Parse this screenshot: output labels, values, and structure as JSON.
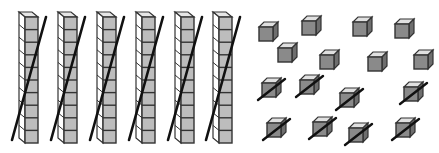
{
  "figure": {
    "colors": {
      "background": "#ffffff",
      "outline": "#333333",
      "rod_front": "#bdbdbd",
      "rod_side": "#ffffff",
      "rod_top": "#e6e6e6",
      "cube_front": "#8a8a8a",
      "cube_top": "#e0e0e0",
      "cube_side": "#6e6e6e",
      "strike": "#111111"
    },
    "rods": {
      "count": 6,
      "cells_per_rod": 10,
      "crossed_out": true,
      "items": [
        {
          "x": 19,
          "crossed": true
        },
        {
          "x": 58,
          "crossed": true
        },
        {
          "x": 97,
          "crossed": true
        },
        {
          "x": 136,
          "crossed": true
        },
        {
          "x": 175,
          "crossed": true
        },
        {
          "x": 213,
          "crossed": true
        }
      ]
    },
    "units": {
      "count": 16,
      "crossed_count": 8,
      "items": [
        {
          "x": 259,
          "y": 22,
          "crossed": false
        },
        {
          "x": 302,
          "y": 16,
          "crossed": false
        },
        {
          "x": 353,
          "y": 17,
          "crossed": false
        },
        {
          "x": 395,
          "y": 19,
          "crossed": false
        },
        {
          "x": 278,
          "y": 43,
          "crossed": false
        },
        {
          "x": 320,
          "y": 50,
          "crossed": false
        },
        {
          "x": 368,
          "y": 52,
          "crossed": false
        },
        {
          "x": 414,
          "y": 50,
          "crossed": false
        },
        {
          "x": 262,
          "y": 78,
          "crossed": true
        },
        {
          "x": 300,
          "y": 75,
          "crossed": true
        },
        {
          "x": 340,
          "y": 88,
          "crossed": true
        },
        {
          "x": 404,
          "y": 82,
          "crossed": true
        },
        {
          "x": 267,
          "y": 118,
          "crossed": true
        },
        {
          "x": 313,
          "y": 117,
          "crossed": true
        },
        {
          "x": 349,
          "y": 123,
          "crossed": true
        },
        {
          "x": 396,
          "y": 118,
          "crossed": true
        }
      ]
    }
  }
}
